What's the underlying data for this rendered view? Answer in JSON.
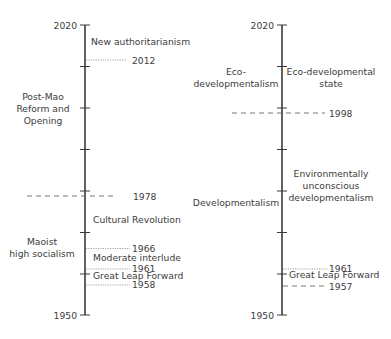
{
  "left_timeline": {
    "axis": {
      "top_label": "2020",
      "bottom_label": "1950"
    },
    "left_periods": [
      {
        "lines": [
          "Post-Mao",
          "Reform and",
          "Opening"
        ]
      },
      {
        "lines": [
          "Maoist",
          "high socialism"
        ]
      }
    ],
    "right_periods": [
      {
        "lines": [
          "New authoritarianism"
        ]
      },
      {
        "lines": [
          "Cultural Revolution"
        ]
      },
      {
        "lines": [
          "Moderate interlude"
        ]
      },
      {
        "lines": [
          "Great Leap Forward"
        ]
      }
    ],
    "markers": [
      {
        "year": "2012",
        "style": "dotted"
      },
      {
        "year": "1978",
        "style": "dashed"
      },
      {
        "year": "1966",
        "style": "dotted"
      },
      {
        "year": "1961",
        "style": "dotted"
      },
      {
        "year": "1958",
        "style": "dotted"
      }
    ]
  },
  "right_timeline": {
    "axis": {
      "top_label": "2020",
      "bottom_label": "1950"
    },
    "left_periods": [
      {
        "lines": [
          "Eco-",
          "developmentalism"
        ]
      },
      {
        "lines": [
          "Developmentalism"
        ]
      }
    ],
    "right_periods": [
      {
        "lines": [
          "Eco-developmental",
          "state"
        ]
      },
      {
        "lines": [
          "Environmentally",
          "unconscious",
          "developmentalism"
        ]
      },
      {
        "lines": [
          "Great Leap Forward"
        ]
      }
    ],
    "markers": [
      {
        "year": "1998",
        "style": "dashed"
      },
      {
        "year": "1961",
        "style": "dotted"
      },
      {
        "year": "1957",
        "style": "dashed"
      }
    ]
  }
}
